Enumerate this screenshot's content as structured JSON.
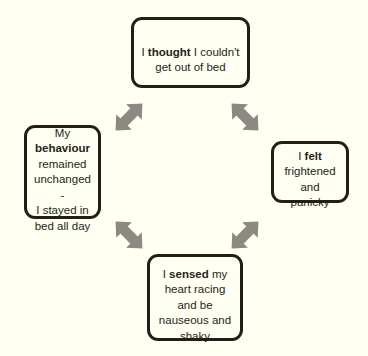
{
  "diagram": {
    "background_color": "#fffff2",
    "node_border_color": "#231f18",
    "arrow_color": "#8a8a82",
    "nodes": [
      {
        "id": "thought",
        "name": "thought-node",
        "prefix": "I ",
        "keyword": "thought",
        "suffix": " I couldn't\nget out of bed",
        "full_text": "I thought I couldn't get out of bed"
      },
      {
        "id": "felt",
        "name": "felt-node",
        "prefix": "I ",
        "keyword": "felt",
        "suffix": "\nfrightened\nand panicky",
        "full_text": "I felt frightened and panicky"
      },
      {
        "id": "sensed",
        "name": "sensed-node",
        "prefix": "I ",
        "keyword": "sensed",
        "suffix": " my\nheart racing\nand be\nnauseous and\nshaky",
        "full_text": "I sensed my heart racing and be nauseous and shaky"
      },
      {
        "id": "behaviour",
        "name": "behaviour-node",
        "prefix": "My\n",
        "keyword": "behaviour",
        "suffix": "\nremained\nunchanged -\nI stayed in\nbed all day",
        "full_text": "My behaviour remained unchanged - I stayed in bed all day"
      }
    ],
    "arrows": [
      {
        "id": "behaviour-thought",
        "name": "arrow-behaviour-thought",
        "style": "double-headed",
        "direction": "up-right"
      },
      {
        "id": "thought-felt",
        "name": "arrow-thought-felt",
        "style": "double-headed",
        "direction": "down-right"
      },
      {
        "id": "felt-sensed",
        "name": "arrow-felt-sensed",
        "style": "double-headed",
        "direction": "up-right"
      },
      {
        "id": "sensed-behaviour",
        "name": "arrow-sensed-behaviour",
        "style": "double-headed",
        "direction": "down-right"
      }
    ]
  }
}
